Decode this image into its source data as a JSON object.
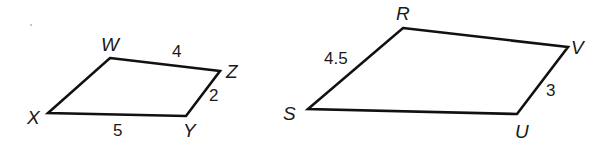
{
  "figures": [
    {
      "name": "WZYX",
      "vertices": [
        {
          "label": "W",
          "x": 110,
          "y": 58,
          "lx": 101,
          "ly": 51
        },
        {
          "label": "Z",
          "x": 220,
          "y": 71,
          "lx": 226,
          "ly": 78
        },
        {
          "label": "Y",
          "x": 186,
          "y": 116,
          "lx": 183,
          "ly": 137
        },
        {
          "label": "X",
          "x": 48,
          "y": 113,
          "lx": 27,
          "ly": 124
        }
      ],
      "sides": [
        {
          "from": "W",
          "to": "Z",
          "length": "4",
          "lx": 172,
          "ly": 57
        },
        {
          "from": "Z",
          "to": "Y",
          "length": "2",
          "lx": 209,
          "ly": 101
        },
        {
          "from": "Y",
          "to": "X",
          "length": "5",
          "lx": 113,
          "ly": 136
        }
      ]
    },
    {
      "name": "RVUS",
      "vertices": [
        {
          "label": "R",
          "x": 403,
          "y": 28,
          "lx": 396,
          "ly": 20
        },
        {
          "label": "V",
          "x": 568,
          "y": 47,
          "lx": 571,
          "ly": 54
        },
        {
          "label": "U",
          "x": 517,
          "y": 114,
          "lx": 515,
          "ly": 138
        },
        {
          "label": "S",
          "x": 308,
          "y": 109,
          "lx": 283,
          "ly": 120
        }
      ],
      "sides": [
        {
          "from": "S",
          "to": "R",
          "length": "4.5",
          "lx": 324,
          "ly": 64
        },
        {
          "from": "V",
          "to": "U",
          "length": "3",
          "lx": 546,
          "ly": 96
        }
      ]
    }
  ]
}
